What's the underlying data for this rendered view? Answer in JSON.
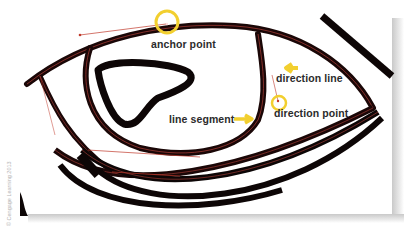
{
  "diagram": {
    "labels": {
      "anchor_point": "anchor point",
      "direction_line": "direction line",
      "direction_point": "direction point",
      "line_segment": "line segment"
    },
    "credit": "© Cengage Learning 2013",
    "colors": {
      "stroke": "#0d0606",
      "path_highlight": "#c0392b",
      "callout": "#f2cf2f",
      "label_text": "#2b2b2b",
      "background": "#ffffff"
    }
  }
}
